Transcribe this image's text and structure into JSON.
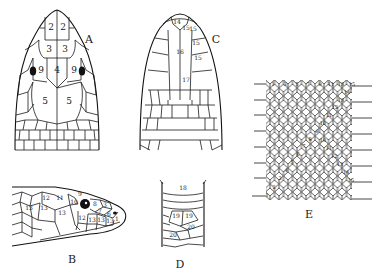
{
  "figure": {
    "type": "snake scale identification diagram",
    "panels": [
      {
        "id": "A",
        "label": "A",
        "view": "dorsal head",
        "scale_numbers": [
          "2",
          "2",
          "3",
          "3",
          "9",
          "4",
          "9",
          "5",
          "5"
        ]
      },
      {
        "id": "B",
        "label": "B",
        "view": "lateral head",
        "scale_numbers": [
          "9",
          "12",
          "11",
          "10",
          "8",
          "3",
          "13",
          "13",
          "13",
          "7",
          "6",
          "12",
          "13",
          "13",
          "13",
          "1"
        ]
      },
      {
        "id": "C",
        "label": "C",
        "view": "ventral head",
        "scale_numbers": [
          "14",
          "15",
          "15",
          "15",
          "16",
          "15",
          "17"
        ]
      },
      {
        "id": "D",
        "label": "D",
        "view": "ventral body / anal region",
        "scale_numbers": [
          "18",
          "19",
          "19",
          "20",
          "20"
        ]
      },
      {
        "id": "E",
        "label": "E",
        "view": "dorsal scale row count",
        "top_row": [
          "1",
          "3",
          "5",
          "7",
          "9",
          "11",
          "13",
          "15"
        ],
        "diagonal_numbers": [
          "1",
          "2",
          "3",
          "4",
          "5",
          "6",
          "7",
          "8",
          "9",
          "10",
          "10",
          "11",
          "11",
          "12",
          "12",
          "13",
          "13",
          "14",
          "14",
          "15"
        ]
      }
    ]
  },
  "colors": {
    "line": "#1a1a1a",
    "background": "#ffffff"
  }
}
